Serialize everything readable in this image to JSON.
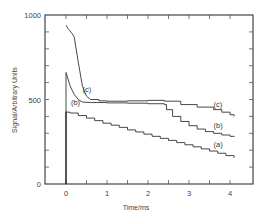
{
  "chart_data": {
    "type": "line",
    "title": "",
    "xlabel": "Time/ms",
    "ylabel": "Signal/Arbitrary Units",
    "xlim": [
      -0.5,
      4.6
    ],
    "ylim": [
      0,
      1000
    ],
    "x_ticks": [
      0,
      1,
      2,
      3,
      4
    ],
    "x_tick_labels": [
      "0",
      "1",
      "2",
      "3",
      "4"
    ],
    "y_tick_labels": [
      "0",
      "500",
      "1000"
    ],
    "y_ticks": [
      0,
      500,
      1000
    ],
    "grid": false,
    "legend": "inline curve labels",
    "series": [
      {
        "name": "(a)",
        "x": [
          0,
          0,
          0.1,
          0.3,
          0.5,
          0.7,
          0.9,
          1.1,
          1.3,
          1.5,
          1.7,
          1.9,
          2.1,
          2.3,
          2.5,
          2.7,
          2.9,
          3.1,
          3.3,
          3.5,
          3.7,
          3.9,
          4.1
        ],
        "y": [
          0,
          425,
          420,
          405,
          390,
          375,
          360,
          348,
          335,
          320,
          308,
          295,
          282,
          270,
          258,
          245,
          232,
          220,
          208,
          195,
          182,
          168,
          155
        ]
      },
      {
        "name": "(b)",
        "x": [
          0,
          0,
          0.05,
          0.1,
          0.2,
          0.3,
          0.4,
          0.6,
          1.0,
          1.5,
          2.0,
          2.4,
          2.45,
          2.6,
          2.8,
          3.0,
          3.2,
          3.4,
          3.6,
          3.8,
          4.0,
          4.1
        ],
        "y": [
          0,
          660,
          620,
          580,
          530,
          500,
          485,
          482,
          480,
          478,
          475,
          470,
          440,
          400,
          370,
          345,
          325,
          310,
          300,
          290,
          282,
          278
        ]
      },
      {
        "name": "(c)",
        "x": [
          0,
          0.05,
          0.15,
          0.2,
          0.3,
          0.4,
          0.5,
          0.6,
          0.8,
          1.0,
          1.5,
          2.0,
          2.4,
          2.8,
          3.2,
          3.6,
          3.8,
          4.0,
          4.1
        ],
        "y": [
          940,
          920,
          890,
          870,
          720,
          580,
          520,
          500,
          492,
          490,
          492,
          495,
          490,
          470,
          455,
          440,
          425,
          410,
          400
        ]
      }
    ],
    "annotations": [
      {
        "text": "(a)",
        "x": 3.6,
        "y": 220
      },
      {
        "text": "(b)",
        "x": 3.6,
        "y": 330
      },
      {
        "text": "(c)",
        "x": 3.6,
        "y": 455
      },
      {
        "text": "(b)",
        "x": 0.12,
        "y": 470
      },
      {
        "text": "(c)",
        "x": 0.4,
        "y": 545
      }
    ]
  }
}
